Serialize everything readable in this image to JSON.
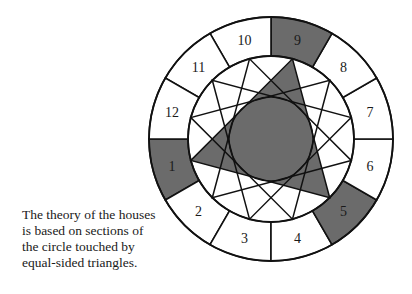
{
  "diagram": {
    "center": [
      271,
      139
    ],
    "outer_radius": 122,
    "ring_inner_radius": 83,
    "core_radius": 42,
    "colors": {
      "shade": "#6b6b6b",
      "stroke": "#111111",
      "background": "#ffffff"
    },
    "houses": [
      {
        "num": "1",
        "shaded": true
      },
      {
        "num": "2",
        "shaded": false
      },
      {
        "num": "3",
        "shaded": false
      },
      {
        "num": "4",
        "shaded": false
      },
      {
        "num": "5",
        "shaded": true
      },
      {
        "num": "6",
        "shaded": false
      },
      {
        "num": "7",
        "shaded": false
      },
      {
        "num": "8",
        "shaded": false
      },
      {
        "num": "9",
        "shaded": true
      },
      {
        "num": "10",
        "shaded": false
      },
      {
        "num": "11",
        "shaded": false
      },
      {
        "num": "12",
        "shaded": false
      }
    ],
    "triangles": [
      {
        "start_angle": -75,
        "shaded": true
      },
      {
        "start_angle": -45,
        "shaded": false
      },
      {
        "start_angle": -15,
        "shaded": false
      },
      {
        "start_angle": 15,
        "shaded": false
      }
    ]
  },
  "caption": {
    "lines": [
      "The theory of the houses",
      "is based on sections of",
      "the circle touched by",
      "equal-sided triangles."
    ]
  }
}
